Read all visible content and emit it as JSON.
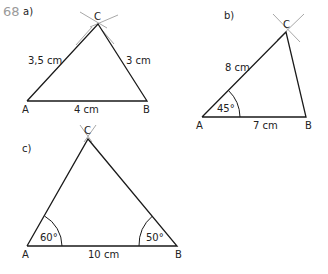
{
  "exercise": {
    "number": "68",
    "number_color": "#9a9a9a"
  },
  "triangles": [
    {
      "label": "a)",
      "vertices": {
        "A": "A",
        "B": "B",
        "C": "C"
      },
      "sides": {
        "AC": "3,5 cm",
        "BC": "3 cm",
        "AB": "4 cm"
      }
    },
    {
      "label": "b)",
      "vertices": {
        "A": "A",
        "B": "B",
        "C": "C"
      },
      "sides": {
        "AC": "8 cm",
        "AB": "7 cm"
      },
      "angles": {
        "A": "45°"
      }
    },
    {
      "label": "c)",
      "vertices": {
        "A": "A",
        "B": "B",
        "C": "C"
      },
      "sides": {
        "AB": "10 cm"
      },
      "angles": {
        "A": "60°",
        "B": "50°"
      }
    }
  ]
}
